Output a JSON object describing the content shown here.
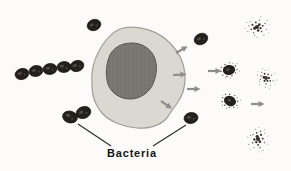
{
  "figure": {
    "type": "biology-illustration",
    "label": "Bacteria"
  },
  "colors": {
    "background": "#fcfbf9",
    "cytoplasm": "#dbd8d1",
    "cell-outline": "#a19e97",
    "nucleus": "#7b7771",
    "nucleus-outline": "#57534d",
    "bacteria": "#24201c",
    "bacteria-outline": "#0f0d0b",
    "bacteria-highlight": "#7d7268",
    "arrow": "#8e8e8b",
    "debris": "#35312d",
    "label": "#141414",
    "pointer": "#2a2a2a"
  },
  "parts": {
    "bacteria_chain_count": 5,
    "bacteria_pair_count": 2,
    "free_bacteria_count": 3,
    "arrow_count": 6,
    "disintegrating_bacteria_count": 2,
    "debris_cluster_count": 3
  }
}
